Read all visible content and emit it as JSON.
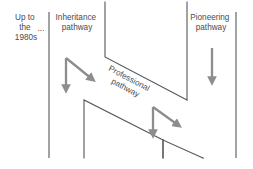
{
  "diagram": {
    "canvas": {
      "width": 253,
      "height": 169
    },
    "colors": {
      "background": "#ffffff",
      "line": "#55565a",
      "arrow": "#8c8d91",
      "text": "#4a4b4f"
    },
    "labels": {
      "era": "Up to\nthe\n1980s",
      "era_ellipsis": "...",
      "inheritance": "Inheritance\npathway",
      "professional": "Professional\npathway",
      "pioneering": "Pioneering\npathway"
    },
    "columns": [
      {
        "name": "era-divider",
        "x": 49,
        "y1": 12,
        "y2": 158
      },
      {
        "name": "inheritance-divider",
        "x": 105,
        "y1": 2,
        "y2": 57
      },
      {
        "name": "professional-divider",
        "x": 187,
        "y1": 2,
        "y2": 100
      },
      {
        "name": "pioneering-divider",
        "x": 236,
        "y1": 12,
        "y2": 158
      }
    ],
    "steps": [
      {
        "name": "step-one",
        "corner_x": 105,
        "corner_y": 57,
        "end_x": 187,
        "end_y": 100
      },
      {
        "name": "step-two",
        "corner_x": 84,
        "corner_y": 100,
        "end_x": 163,
        "end_y": 140,
        "stem_y2": 158
      },
      {
        "name": "step-three",
        "corner_x": 163,
        "corner_y": 140,
        "end_x": 203,
        "end_y": 158,
        "stem_y2": 158
      }
    ],
    "arrows": [
      {
        "name": "inheritance-down-arrow",
        "x1": 66,
        "y1": 58,
        "x2": 66,
        "y2": 91
      },
      {
        "name": "inheritance-diagonal-arrow",
        "x1": 66,
        "y1": 58,
        "x2": 94,
        "y2": 81
      },
      {
        "name": "professional-down-arrow",
        "x1": 153,
        "y1": 107,
        "x2": 153,
        "y2": 136
      },
      {
        "name": "professional-diagonal-arrow",
        "x1": 153,
        "y1": 107,
        "x2": 180,
        "y2": 127
      },
      {
        "name": "pioneering-down-arrow",
        "x1": 212,
        "y1": 48,
        "x2": 212,
        "y2": 83
      }
    ]
  }
}
